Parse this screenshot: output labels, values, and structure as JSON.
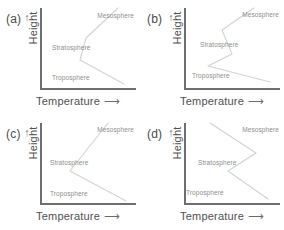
{
  "figure": {
    "caption": "",
    "panels": [
      {
        "key": "a",
        "label": "(a)",
        "y_axis": {
          "title": "Height",
          "arrow": "↑"
        },
        "x_axis": {
          "title": "Temperature",
          "arrow": "⟶"
        },
        "layers": [
          {
            "name": "Mesosphere"
          },
          {
            "name": "Stratosphere"
          },
          {
            "name": "Troposphere"
          }
        ]
      },
      {
        "key": "b",
        "label": "(b)",
        "y_axis": {
          "title": "Height",
          "arrow": "↑"
        },
        "x_axis": {
          "title": "Temperature",
          "arrow": "⟶"
        },
        "layers": [
          {
            "name": "Mesosphere"
          },
          {
            "name": "Stratosphere"
          },
          {
            "name": "Troposphere"
          }
        ]
      },
      {
        "key": "c",
        "label": "(c)",
        "y_axis": {
          "title": "Height",
          "arrow": "↑"
        },
        "x_axis": {
          "title": "Temperature",
          "arrow": "⟶"
        },
        "layers": [
          {
            "name": "Mesosphere"
          },
          {
            "name": "Stratosphere"
          },
          {
            "name": "Troposphere"
          }
        ]
      },
      {
        "key": "d",
        "label": "(d)",
        "y_axis": {
          "title": "Height",
          "arrow": "↑"
        },
        "x_axis": {
          "title": "Temperature",
          "arrow": "⟶"
        },
        "layers": [
          {
            "name": "Mesosphere"
          },
          {
            "name": "Stratosphere"
          },
          {
            "name": "Troposphere"
          }
        ]
      }
    ]
  },
  "colors": {
    "axis": "#6e6e6e",
    "curve": "#d2d2d2",
    "layer_text": "#8d8d8d",
    "axis_text": "#4f4f4f",
    "panel_label": "#4a4a4a",
    "background": "#ffffff"
  },
  "chart_data": {
    "type": "line",
    "title": "",
    "xlabel": "Temperature",
    "ylabel": "Height",
    "grid": false,
    "legend": "none",
    "xlim": [
      0,
      96
    ],
    "ylim": [
      0,
      82
    ],
    "note": "Four multiple-choice variants of an atmospheric temperature profile. Each panel plots a zigzag temperature-vs-height curve across three labelled layers: Troposphere (lowest), Stratosphere (middle), Mesosphere (top). Curve coordinates are in plot-box pixels with y measured downward from the top of the plot box (y=0 top, y=82 bottom of box).",
    "series": [
      {
        "name": "a",
        "panel": "a",
        "points": [
          {
            "x": 78,
            "y": 0
          },
          {
            "x": 46,
            "y": 30
          },
          {
            "x": 40,
            "y": 52
          },
          {
            "x": 84,
            "y": 76
          }
        ]
      },
      {
        "name": "b",
        "panel": "b",
        "points": [
          {
            "x": 70,
            "y": 0
          },
          {
            "x": 38,
            "y": 22
          },
          {
            "x": 48,
            "y": 46
          },
          {
            "x": 24,
            "y": 58
          },
          {
            "x": 86,
            "y": 74
          }
        ]
      },
      {
        "name": "c",
        "panel": "c",
        "points": [
          {
            "x": 68,
            "y": 0
          },
          {
            "x": 30,
            "y": 48
          },
          {
            "x": 86,
            "y": 78
          }
        ]
      },
      {
        "name": "d",
        "panel": "d",
        "points": [
          {
            "x": 26,
            "y": 0
          },
          {
            "x": 72,
            "y": 30
          },
          {
            "x": 44,
            "y": 48
          },
          {
            "x": 84,
            "y": 76
          }
        ]
      }
    ]
  }
}
